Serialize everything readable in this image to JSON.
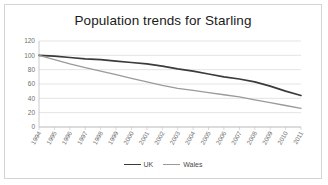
{
  "chart_data": {
    "type": "line",
    "title": "Population trends for Starling",
    "xlabel": "",
    "ylabel": "",
    "ylim": [
      0,
      120
    ],
    "ytick_values": [
      0,
      20,
      40,
      60,
      80,
      100,
      120
    ],
    "ytick_labels": [
      "0",
      "20",
      "40",
      "60",
      "80",
      "100",
      "120"
    ],
    "grid": true,
    "legend_position": "bottom",
    "categories": [
      "1994",
      "1995",
      "1996",
      "1997",
      "1998",
      "1999",
      "2000",
      "2001",
      "2002",
      "2003",
      "2004",
      "2005",
      "2006",
      "2007",
      "2008",
      "2009",
      "2010",
      "2011"
    ],
    "series": [
      {
        "name": "UK",
        "color": "#3b3b3b",
        "values": [
          100,
          99,
          97,
          95,
          94,
          92,
          90,
          88,
          85,
          81,
          78,
          74,
          70,
          67,
          63,
          57,
          50,
          44
        ]
      },
      {
        "name": "Wales",
        "color": "#9a9a9a",
        "values": [
          100,
          94,
          88,
          83,
          78,
          73,
          68,
          63,
          58,
          54,
          51,
          48,
          45,
          42,
          38,
          34,
          30,
          26
        ]
      }
    ]
  },
  "frame": {
    "border_color": "#d4d4d4",
    "background": "#ffffff"
  }
}
